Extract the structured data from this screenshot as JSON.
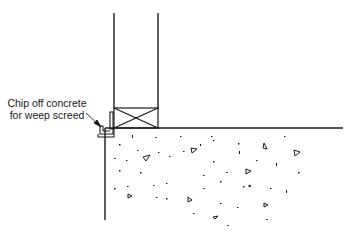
{
  "diagram": {
    "type": "construction-section-detail",
    "callout": {
      "line1": "Chip off concrete",
      "line2": "for weep screed"
    },
    "elements": [
      "wall-framing",
      "bottom-plate-with-x-blocking",
      "weep-screed",
      "concrete-slab",
      "aggregate-stipple"
    ],
    "colors": {
      "stroke": "#1a1a1a",
      "background": "#ffffff"
    }
  }
}
